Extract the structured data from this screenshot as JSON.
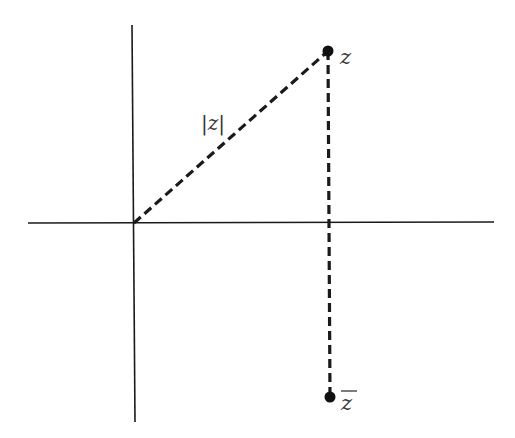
{
  "diagram": {
    "type": "complex-plane",
    "colors": {
      "axis": "#1a1a1a",
      "dashed": "#1a1a1a",
      "point": "#111111",
      "label": "#333333",
      "background": "#ffffff"
    },
    "axes": {
      "horizontal": {
        "x1": 28,
        "y1": 223,
        "x2": 494,
        "y2": 222
      },
      "vertical": {
        "x1": 132,
        "y1": 25,
        "x2": 135,
        "y2": 422
      }
    },
    "origin": {
      "x": 134,
      "y": 223
    },
    "points": [
      {
        "id": "z",
        "label": "z",
        "x": 328,
        "y": 51
      },
      {
        "id": "zbar",
        "label": "z̄",
        "x": 330,
        "y": 397
      }
    ],
    "segments": [
      {
        "id": "modulus",
        "label": "|z|",
        "from": "origin",
        "to": "z",
        "style": "dashed"
      },
      {
        "id": "conjugate-link",
        "label": "",
        "from": "z",
        "to": "zbar",
        "style": "dashed"
      }
    ],
    "labels": {
      "z": "z",
      "zbar_letter": "z",
      "modulus": "|z|"
    }
  }
}
